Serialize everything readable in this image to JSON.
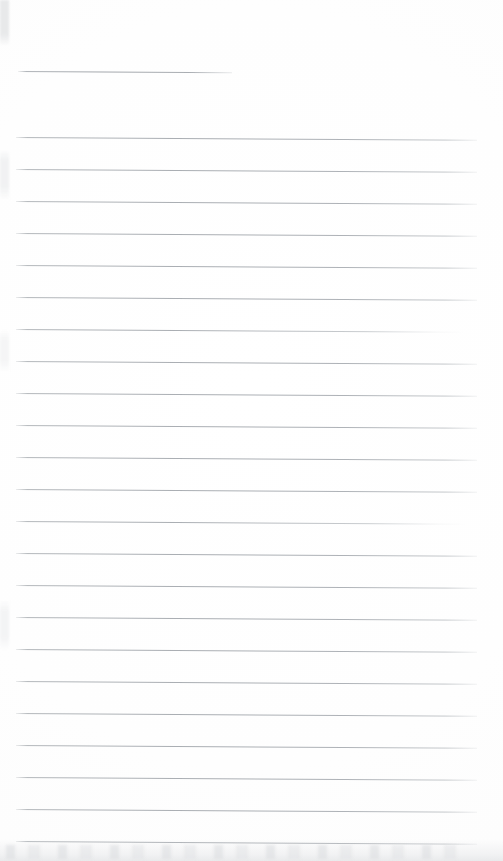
{
  "document": {
    "kind": "scanned-ruled-paper",
    "title": "",
    "visible_text": "",
    "page_width": 503,
    "page_height": 861,
    "background_color": "#fefefe",
    "rule_color": "#aeb2b7",
    "rule_thickness_px": 1,
    "rule_spacing_px": 32,
    "rule_skew_degrees": 0.35,
    "left_margin_px": 16,
    "right_edge_px": 477,
    "notes": "Blank lined notebook page scan; no printed or handwritten text present.",
    "artifacts": {
      "bottom_edge_smudge": "faint grey scanner noise band",
      "left_edge_marks": "faint grey dust specks along left border"
    }
  },
  "rules": [
    {
      "id": "rule-header",
      "x": 18,
      "y": 71,
      "length": 214,
      "variant": "short"
    },
    {
      "id": "rule-1",
      "x": 16,
      "y": 137,
      "length": 461,
      "variant": "full"
    },
    {
      "id": "rule-2",
      "x": 16,
      "y": 169,
      "length": 461,
      "variant": "full"
    },
    {
      "id": "rule-3",
      "x": 16,
      "y": 201,
      "length": 461,
      "variant": "full"
    },
    {
      "id": "rule-4",
      "x": 16,
      "y": 233,
      "length": 461,
      "variant": "full"
    },
    {
      "id": "rule-5",
      "x": 16,
      "y": 265,
      "length": 461,
      "variant": "full"
    },
    {
      "id": "rule-6",
      "x": 16,
      "y": 297,
      "length": 461,
      "variant": "full"
    },
    {
      "id": "rule-7",
      "x": 16,
      "y": 329,
      "length": 448,
      "variant": "faded-right"
    },
    {
      "id": "rule-8",
      "x": 16,
      "y": 361,
      "length": 461,
      "variant": "full"
    },
    {
      "id": "rule-9",
      "x": 16,
      "y": 393,
      "length": 461,
      "variant": "full"
    },
    {
      "id": "rule-10",
      "x": 16,
      "y": 425,
      "length": 461,
      "variant": "full"
    },
    {
      "id": "rule-11",
      "x": 16,
      "y": 457,
      "length": 461,
      "variant": "full"
    },
    {
      "id": "rule-12",
      "x": 16,
      "y": 489,
      "length": 461,
      "variant": "full"
    },
    {
      "id": "rule-13",
      "x": 16,
      "y": 521,
      "length": 450,
      "variant": "faded-right"
    },
    {
      "id": "rule-14",
      "x": 16,
      "y": 553,
      "length": 461,
      "variant": "full"
    },
    {
      "id": "rule-15",
      "x": 16,
      "y": 585,
      "length": 461,
      "variant": "full"
    },
    {
      "id": "rule-16",
      "x": 16,
      "y": 617,
      "length": 461,
      "variant": "full"
    },
    {
      "id": "rule-17",
      "x": 16,
      "y": 649,
      "length": 461,
      "variant": "full"
    },
    {
      "id": "rule-18",
      "x": 16,
      "y": 681,
      "length": 461,
      "variant": "full"
    },
    {
      "id": "rule-19",
      "x": 16,
      "y": 713,
      "length": 461,
      "variant": "full"
    },
    {
      "id": "rule-20",
      "x": 16,
      "y": 745,
      "length": 461,
      "variant": "full"
    },
    {
      "id": "rule-21",
      "x": 16,
      "y": 777,
      "length": 461,
      "variant": "full"
    },
    {
      "id": "rule-22",
      "x": 16,
      "y": 809,
      "length": 461,
      "variant": "full"
    },
    {
      "id": "rule-23",
      "x": 16,
      "y": 841,
      "length": 461,
      "variant": "full"
    }
  ]
}
